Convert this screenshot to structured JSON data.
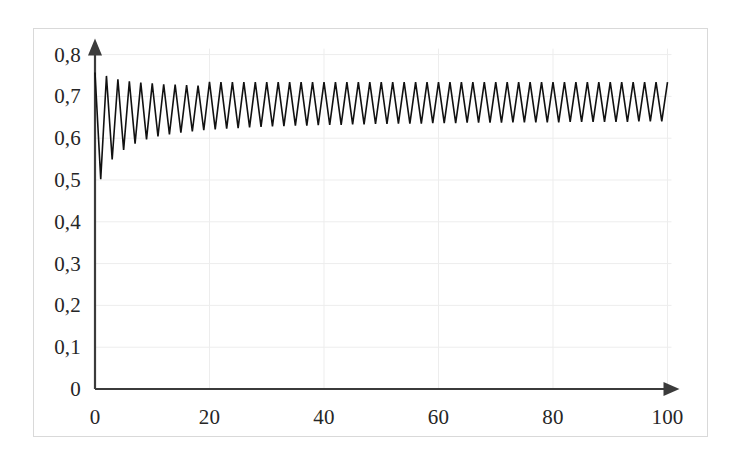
{
  "figure": {
    "border_color": "#d9d9d9",
    "background": "#ffffff",
    "width": 675,
    "height": 409
  },
  "axes": {
    "axis_color": "#3b3b3b",
    "gridline_color": "#ededed",
    "y_axis_name": "y-axis-arrow",
    "x_axis_name": "x-axis-arrow"
  },
  "chart_data": {
    "type": "line",
    "title": "",
    "xlabel": "",
    "ylabel": "",
    "xlim": [
      0,
      100
    ],
    "ylim": [
      0,
      0.8
    ],
    "grid": true,
    "legend": false,
    "legend_position": "none",
    "decimal_separator": ",",
    "x_ticks": [
      0,
      20,
      40,
      60,
      80,
      100
    ],
    "x_tick_labels": [
      "0",
      "20",
      "40",
      "60",
      "80",
      "100"
    ],
    "y_ticks": [
      0,
      0.1,
      0.2,
      0.3,
      0.4,
      0.5,
      0.6,
      0.7,
      0.8
    ],
    "y_tick_labels": [
      "0",
      "0,1",
      "0,2",
      "0,3",
      "0,4",
      "0,5",
      "0,6",
      "0,7",
      "0,8"
    ],
    "series": [
      {
        "name": "damped oscillation",
        "color": "#111111",
        "line_width": 1.6,
        "description": "Discrete-time iteration starting near 0.76, dropping to 0.50, then oscillating with slowly decaying amplitude toward a period-2 cycle between about 0.64 and 0.735.",
        "x": [
          0,
          1,
          2,
          3,
          4,
          5,
          6,
          7,
          8,
          9,
          10,
          11,
          12,
          13,
          14,
          15,
          16,
          17,
          18,
          19,
          20,
          21,
          22,
          23,
          24,
          25,
          26,
          27,
          28,
          29,
          30,
          31,
          32,
          33,
          34,
          35,
          36,
          37,
          38,
          39,
          40,
          41,
          42,
          43,
          44,
          45,
          46,
          47,
          48,
          49,
          50,
          51,
          52,
          53,
          54,
          55,
          56,
          57,
          58,
          59,
          60,
          61,
          62,
          63,
          64,
          65,
          66,
          67,
          68,
          69,
          70,
          71,
          72,
          73,
          74,
          75,
          76,
          77,
          78,
          79,
          80,
          81,
          82,
          83,
          84,
          85,
          86,
          87,
          88,
          89,
          90,
          91,
          92,
          93,
          94,
          95,
          96,
          97,
          98,
          99,
          100
        ],
        "y": [
          0.757,
          0.502,
          0.749,
          0.549,
          0.741,
          0.572,
          0.736,
          0.587,
          0.733,
          0.597,
          0.731,
          0.604,
          0.729,
          0.609,
          0.728,
          0.613,
          0.727,
          0.616,
          0.726,
          0.619,
          0.735,
          0.621,
          0.734,
          0.623,
          0.734,
          0.624,
          0.734,
          0.626,
          0.734,
          0.627,
          0.734,
          0.628,
          0.734,
          0.629,
          0.734,
          0.63,
          0.734,
          0.63,
          0.734,
          0.631,
          0.734,
          0.632,
          0.734,
          0.632,
          0.734,
          0.633,
          0.734,
          0.633,
          0.734,
          0.634,
          0.734,
          0.634,
          0.734,
          0.635,
          0.734,
          0.635,
          0.734,
          0.635,
          0.734,
          0.636,
          0.734,
          0.636,
          0.734,
          0.636,
          0.734,
          0.637,
          0.734,
          0.637,
          0.734,
          0.637,
          0.734,
          0.637,
          0.734,
          0.638,
          0.734,
          0.638,
          0.734,
          0.638,
          0.734,
          0.638,
          0.734,
          0.638,
          0.734,
          0.639,
          0.734,
          0.639,
          0.734,
          0.639,
          0.734,
          0.639,
          0.734,
          0.639,
          0.734,
          0.639,
          0.734,
          0.64,
          0.734,
          0.64,
          0.734,
          0.64,
          0.734
        ]
      }
    ]
  }
}
